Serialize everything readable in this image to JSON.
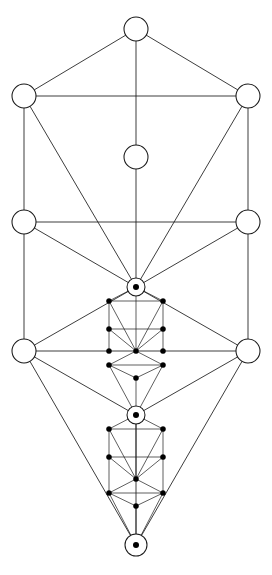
{
  "diagram": {
    "subtitle": "Recursive Otz Chiim with nested sub-trees",
    "background_color": "#ffffff",
    "line_color": "#1a1a1a",
    "node_fill_color": "#ffffff",
    "dot_color": "#000000",
    "canvas": {
      "width": 272,
      "height": 575
    },
    "style": {
      "line_width": 0.85,
      "open_node_radius": 12,
      "ringed_node_radius": 9,
      "ringed_node_core_radius": 3,
      "small_dot_radius": 2.6
    }
  },
  "main_tree": {
    "label": "primary-tree",
    "nodes": [
      {
        "id": "kether",
        "label": "1",
        "x": 136,
        "y": 29,
        "r": 12,
        "kind": "open"
      },
      {
        "id": "binah",
        "label": "3",
        "x": 24,
        "y": 96,
        "r": 12,
        "kind": "open"
      },
      {
        "id": "chokmah",
        "label": "2",
        "x": 248,
        "y": 96,
        "r": 12,
        "kind": "open"
      },
      {
        "id": "daath",
        "label": "11",
        "x": 136,
        "y": 157,
        "r": 12,
        "kind": "open"
      },
      {
        "id": "geburah",
        "label": "5",
        "x": 24,
        "y": 222,
        "r": 12,
        "kind": "open"
      },
      {
        "id": "chesed",
        "label": "4",
        "x": 248,
        "y": 222,
        "r": 12,
        "kind": "open"
      },
      {
        "id": "tiphareth",
        "label": "6",
        "x": 136,
        "y": 287,
        "r": 9,
        "kind": "ringed"
      },
      {
        "id": "hod",
        "label": "8",
        "x": 24,
        "y": 351,
        "r": 12,
        "kind": "open"
      },
      {
        "id": "netzach",
        "label": "7",
        "x": 248,
        "y": 351,
        "r": 12,
        "kind": "open"
      },
      {
        "id": "yesod",
        "label": "9",
        "x": 136,
        "y": 415,
        "r": 9,
        "kind": "ringed"
      },
      {
        "id": "malkuth",
        "label": "10",
        "x": 136,
        "y": 545,
        "r": 11,
        "kind": "ringed"
      }
    ],
    "paths": [
      [
        "kether",
        "binah"
      ],
      [
        "kether",
        "chokmah"
      ],
      [
        "kether",
        "daath"
      ],
      [
        "binah",
        "chokmah"
      ],
      [
        "binah",
        "geburah"
      ],
      [
        "chokmah",
        "chesed"
      ],
      [
        "binah",
        "tiphareth"
      ],
      [
        "chokmah",
        "tiphareth"
      ],
      [
        "daath",
        "tiphareth"
      ],
      [
        "geburah",
        "chesed"
      ],
      [
        "geburah",
        "tiphareth"
      ],
      [
        "chesed",
        "tiphareth"
      ],
      [
        "geburah",
        "hod"
      ],
      [
        "chesed",
        "netzach"
      ],
      [
        "hod",
        "netzach"
      ],
      [
        "hod",
        "tiphareth"
      ],
      [
        "netzach",
        "tiphareth"
      ],
      [
        "hod",
        "yesod"
      ],
      [
        "netzach",
        "yesod"
      ],
      [
        "hod",
        "malkuth"
      ],
      [
        "netzach",
        "malkuth"
      ],
      [
        "yesod",
        "malkuth"
      ]
    ]
  },
  "sub_trees": [
    {
      "id": "sub-tree-tiphareth",
      "label": "sub-tree-from-tiphareth",
      "origin_node": "tiphareth",
      "top": {
        "x": 136,
        "y": 287
      },
      "scale_width": 27,
      "rows": [
        96,
        222,
        287,
        351,
        415,
        545
      ],
      "nodes": [
        {
          "id": "st1-kether",
          "x": 136,
          "y": 287,
          "r": 9,
          "kind": "ringed"
        },
        {
          "id": "st1-binah",
          "x": 109,
          "y": 301,
          "r": 2.6,
          "kind": "dot"
        },
        {
          "id": "st1-chokmah",
          "x": 163,
          "y": 301,
          "r": 2.6,
          "kind": "dot"
        },
        {
          "id": "st1-geburah",
          "x": 109,
          "y": 329,
          "r": 2.6,
          "kind": "dot"
        },
        {
          "id": "st1-chesed",
          "x": 163,
          "y": 329,
          "r": 2.6,
          "kind": "dot"
        },
        {
          "id": "st1-tiphareth",
          "x": 136,
          "y": 351,
          "r": 2.6,
          "kind": "dot"
        },
        {
          "id": "st1-hod",
          "x": 109,
          "y": 351,
          "r": 2.6,
          "kind": "dot"
        },
        {
          "id": "st1-netzach",
          "x": 163,
          "y": 351,
          "r": 2.6,
          "kind": "dot"
        },
        {
          "id": "st1-hod2",
          "x": 109,
          "y": 365,
          "r": 2.6,
          "kind": "dot"
        },
        {
          "id": "st1-netzach2",
          "x": 163,
          "y": 365,
          "r": 2.6,
          "kind": "dot"
        },
        {
          "id": "st1-yesod",
          "x": 136,
          "y": 378,
          "r": 2.6,
          "kind": "dot"
        },
        {
          "id": "st1-malkuth",
          "x": 136,
          "y": 415,
          "r": 9,
          "kind": "ringed"
        }
      ],
      "paths": [
        [
          "st1-kether",
          "st1-binah"
        ],
        [
          "st1-kether",
          "st1-chokmah"
        ],
        [
          "st1-kether",
          "st1-tiphareth"
        ],
        [
          "st1-binah",
          "st1-chokmah"
        ],
        [
          "st1-binah",
          "st1-geburah"
        ],
        [
          "st1-chokmah",
          "st1-chesed"
        ],
        [
          "st1-binah",
          "st1-tiphareth"
        ],
        [
          "st1-chokmah",
          "st1-tiphareth"
        ],
        [
          "st1-geburah",
          "st1-chesed"
        ],
        [
          "st1-geburah",
          "st1-tiphareth"
        ],
        [
          "st1-chesed",
          "st1-tiphareth"
        ],
        [
          "st1-geburah",
          "st1-hod"
        ],
        [
          "st1-chesed",
          "st1-netzach"
        ],
        [
          "st1-hod2",
          "st1-netzach2"
        ],
        [
          "st1-hod2",
          "st1-tiphareth"
        ],
        [
          "st1-netzach2",
          "st1-tiphareth"
        ],
        [
          "st1-hod2",
          "st1-yesod"
        ],
        [
          "st1-netzach2",
          "st1-yesod"
        ],
        [
          "st1-hod2",
          "st1-malkuth"
        ],
        [
          "st1-netzach2",
          "st1-malkuth"
        ],
        [
          "st1-yesod",
          "st1-malkuth"
        ]
      ]
    },
    {
      "id": "sub-tree-yesod",
      "label": "sub-tree-from-yesod",
      "origin_node": "yesod",
      "top": {
        "x": 136,
        "y": 415
      },
      "scale_width": 27,
      "rows": [
        429,
        457,
        479,
        493,
        506,
        545
      ],
      "nodes": [
        {
          "id": "st2-kether",
          "x": 136,
          "y": 415,
          "r": 9,
          "kind": "ringed"
        },
        {
          "id": "st2-binah",
          "x": 109,
          "y": 429,
          "r": 2.6,
          "kind": "dot"
        },
        {
          "id": "st2-chokmah",
          "x": 163,
          "y": 429,
          "r": 2.6,
          "kind": "dot"
        },
        {
          "id": "st2-geburah",
          "x": 109,
          "y": 457,
          "r": 2.6,
          "kind": "dot"
        },
        {
          "id": "st2-chesed",
          "x": 163,
          "y": 457,
          "r": 2.6,
          "kind": "dot"
        },
        {
          "id": "st2-tiphareth",
          "x": 136,
          "y": 479,
          "r": 2.6,
          "kind": "dot"
        },
        {
          "id": "st2-hod",
          "x": 109,
          "y": 493,
          "r": 2.6,
          "kind": "dot"
        },
        {
          "id": "st2-netzach",
          "x": 163,
          "y": 493,
          "r": 2.6,
          "kind": "dot"
        },
        {
          "id": "st2-yesod",
          "x": 136,
          "y": 506,
          "r": 2.6,
          "kind": "dot"
        },
        {
          "id": "st2-malkuth",
          "x": 136,
          "y": 545,
          "r": 11,
          "kind": "ringed"
        }
      ],
      "paths": [
        [
          "st2-kether",
          "st2-binah"
        ],
        [
          "st2-kether",
          "st2-chokmah"
        ],
        [
          "st2-kether",
          "st2-tiphareth"
        ],
        [
          "st2-binah",
          "st2-chokmah"
        ],
        [
          "st2-binah",
          "st2-geburah"
        ],
        [
          "st2-chokmah",
          "st2-chesed"
        ],
        [
          "st2-binah",
          "st2-tiphareth"
        ],
        [
          "st2-chokmah",
          "st2-tiphareth"
        ],
        [
          "st2-geburah",
          "st2-chesed"
        ],
        [
          "st2-geburah",
          "st2-tiphareth"
        ],
        [
          "st2-chesed",
          "st2-tiphareth"
        ],
        [
          "st2-geburah",
          "st2-hod"
        ],
        [
          "st2-chesed",
          "st2-netzach"
        ],
        [
          "st2-hod",
          "st2-netzach"
        ],
        [
          "st2-hod",
          "st2-tiphareth"
        ],
        [
          "st2-netzach",
          "st2-tiphareth"
        ],
        [
          "st2-hod",
          "st2-yesod"
        ],
        [
          "st2-netzach",
          "st2-yesod"
        ],
        [
          "st2-hod",
          "st2-malkuth"
        ],
        [
          "st2-netzach",
          "st2-malkuth"
        ],
        [
          "st2-yesod",
          "st2-malkuth"
        ]
      ]
    }
  ]
}
